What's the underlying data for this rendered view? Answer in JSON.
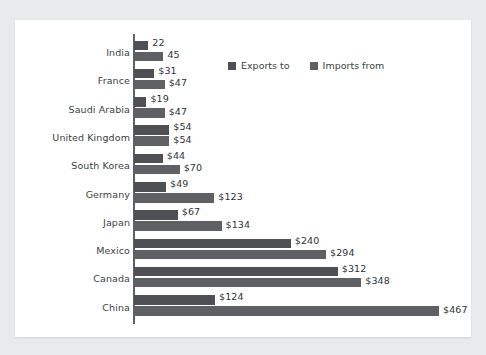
{
  "chart_data": {
    "type": "bar",
    "orientation": "horizontal",
    "title": "",
    "xlabel": "",
    "ylabel": "",
    "grid": false,
    "legend_position": "top-right",
    "xlim": [
      0,
      467
    ],
    "categories": [
      "India",
      "France",
      "Saudi Arabia",
      "United Kingdom",
      "South Korea",
      "Germany",
      "Japan",
      "Mexico",
      "Canada",
      "China"
    ],
    "series": [
      {
        "name": "Exports to",
        "color": "#4f5054",
        "values": [
          22,
          31,
          19,
          54,
          44,
          49,
          67,
          240,
          312,
          124
        ],
        "labels": [
          "22",
          "$31",
          "$19",
          "$54",
          "$44",
          "$49",
          "$67",
          "$240",
          "$312",
          "$124"
        ]
      },
      {
        "name": "Imports from",
        "color": "#5f6064",
        "values": [
          45,
          47,
          47,
          54,
          70,
          123,
          134,
          294,
          348,
          467
        ],
        "labels": [
          "45",
          "$47",
          "$47",
          "$54",
          "$70",
          "$123",
          "$134",
          "$294",
          "$348",
          "$467"
        ]
      }
    ]
  },
  "legend": {
    "items": [
      {
        "label": "Exports to"
      },
      {
        "label": "Imports from"
      }
    ]
  }
}
